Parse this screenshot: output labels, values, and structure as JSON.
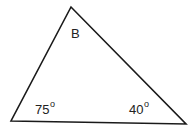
{
  "diagram": {
    "type": "triangle",
    "stroke_color": "#1a1a1a",
    "background": "#ffffff",
    "vertices": {
      "top": [
        71,
        7
      ],
      "bottom_left": [
        11,
        121
      ],
      "bottom_right": [
        186,
        124
      ]
    },
    "labels": {
      "top_angle": "B",
      "bottom_left_angle": "75",
      "bottom_right_angle": "40",
      "degree_symbol": "o"
    }
  }
}
